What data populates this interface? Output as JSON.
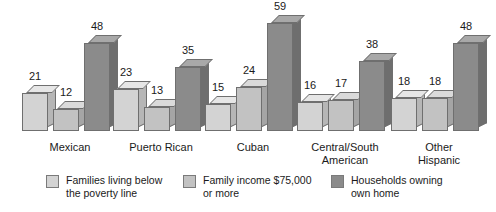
{
  "chart_data": {
    "type": "bar",
    "title": "",
    "subtitle": "",
    "xlabel": "",
    "ylabel": "",
    "ylim": [
      0,
      59
    ],
    "grid": false,
    "legend_position": "bottom",
    "orientation": "vertical",
    "style": "3d-grouped-bars",
    "data_labels": true,
    "categories": [
      "Mexican",
      "Puerto Rican",
      "Cuban",
      "Central/South American",
      "Other Hispanic"
    ],
    "series": [
      {
        "name": "Families living below the poverty line",
        "color": "#d3d3d3",
        "values": [
          21,
          23,
          15,
          16,
          18
        ]
      },
      {
        "name": "Family income $75,000 or more",
        "color": "#c2c2c2",
        "values": [
          12,
          13,
          24,
          17,
          18
        ]
      },
      {
        "name": "Households owning own home",
        "color": "#8b8b8b",
        "values": [
          48,
          35,
          59,
          38,
          48
        ]
      }
    ]
  },
  "categories_display": [
    {
      "line1": "Mexican",
      "line2": ""
    },
    {
      "line1": "Puerto Rican",
      "line2": ""
    },
    {
      "line1": "Cuban",
      "line2": ""
    },
    {
      "line1": "Central/South",
      "line2": "American"
    },
    {
      "line1": "Other",
      "line2": "Hispanic"
    }
  ],
  "legend": {
    "items": [
      {
        "label": "Families living below\nthe poverty line",
        "color": "#d3d3d3"
      },
      {
        "label": "Family income $75,000\nor more",
        "color": "#c2c2c2"
      },
      {
        "label": "Households owning\nown home",
        "color": "#8b8b8b"
      }
    ]
  }
}
